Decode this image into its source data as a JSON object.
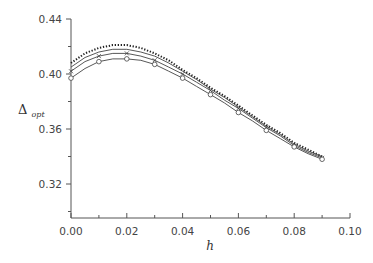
{
  "chart_data": {
    "type": "line",
    "title": "",
    "xlabel": "h",
    "ylabel": "Δ_opt",
    "ylabel_main": "Δ",
    "ylabel_sub": "opt",
    "xlim": [
      0.0,
      0.1
    ],
    "ylim": [
      0.295,
      0.44
    ],
    "xticks": [
      "0.00",
      "0.02",
      "0.04",
      "0.06",
      "0.08",
      "0.10"
    ],
    "yticks": [
      "0.32",
      "0.36",
      "0.40",
      "0.44"
    ],
    "grid": false,
    "legend": null,
    "x": [
      0.0,
      0.005,
      0.01,
      0.015,
      0.02,
      0.025,
      0.03,
      0.035,
      0.04,
      0.045,
      0.05,
      0.055,
      0.06,
      0.065,
      0.07,
      0.075,
      0.08,
      0.085,
      0.09
    ],
    "series": [
      {
        "name": "series-dotted",
        "marker": "dot",
        "values": [
          0.408,
          0.415,
          0.419,
          0.421,
          0.421,
          0.419,
          0.415,
          0.41,
          0.403,
          0.397,
          0.39,
          0.384,
          0.377,
          0.37,
          0.363,
          0.357,
          0.35,
          0.345,
          0.34
        ]
      },
      {
        "name": "series-plain",
        "marker": "none",
        "values": [
          0.405,
          0.412,
          0.416,
          0.418,
          0.418,
          0.416,
          0.413,
          0.408,
          0.402,
          0.396,
          0.389,
          0.383,
          0.376,
          0.369,
          0.362,
          0.356,
          0.349,
          0.344,
          0.34
        ]
      },
      {
        "name": "series-cross",
        "marker": "x",
        "values": [
          0.402,
          0.409,
          0.413,
          0.415,
          0.415,
          0.413,
          0.41,
          0.405,
          0.4,
          0.394,
          0.388,
          0.381,
          0.375,
          0.368,
          0.361,
          0.355,
          0.348,
          0.343,
          0.339
        ]
      },
      {
        "name": "series-circle",
        "marker": "o",
        "values": [
          0.397,
          0.404,
          0.409,
          0.411,
          0.411,
          0.41,
          0.407,
          0.402,
          0.397,
          0.391,
          0.385,
          0.379,
          0.372,
          0.366,
          0.359,
          0.353,
          0.347,
          0.342,
          0.338
        ]
      }
    ]
  }
}
